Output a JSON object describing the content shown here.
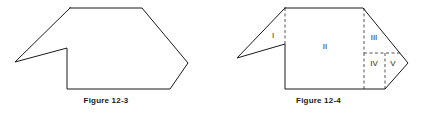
{
  "page": {
    "background_color": "#ffffff",
    "width": 425,
    "height": 115
  },
  "figures": [
    {
      "id": "figure-12-3",
      "caption": "Figure 12-3",
      "stroke_color": "#1a1a1a",
      "stroke_width": 1,
      "description": "Concave polygon outline: an arrow/house-like hexagonal shape with a notch cut into the left side",
      "outline_points": "70,8 142,8 188,63 170,89 67,89 67,48 15,62 70,8",
      "region_labels": []
    },
    {
      "id": "figure-12-4",
      "caption": "Figure 12-4",
      "stroke_color": "#1a1a1a",
      "stroke_width": 1,
      "dashed_color": "#555555",
      "description": "Same concave polygon as Figure 12-3 subdivided by dashed lines into five labeled regions",
      "outline_points": "285,8 363,8 408,63 385,89 285,89 285,44 237,58 285,8",
      "dashed_lines": [
        {
          "name": "divider-I-II",
          "x1": 285,
          "y1": 8,
          "x2": 285,
          "y2": 44
        },
        {
          "name": "divider-II-III",
          "x1": 364,
          "y1": 8,
          "x2": 364,
          "y2": 53
        },
        {
          "name": "divider-II-IV",
          "x1": 364,
          "y1": 53,
          "x2": 364,
          "y2": 89
        },
        {
          "name": "divider-III-IV",
          "x1": 364,
          "y1": 53,
          "x2": 401,
          "y2": 53
        },
        {
          "name": "divider-IV-V",
          "x1": 385,
          "y1": 53,
          "x2": 385,
          "y2": 89
        }
      ],
      "region_labels": [
        {
          "name": "region-label-i",
          "text": "I",
          "x": 273,
          "y": 36
        },
        {
          "name": "region-label-ii",
          "text": "II",
          "x": 325,
          "y": 47
        },
        {
          "name": "region-label-iii",
          "text": "III",
          "x": 374,
          "y": 38
        },
        {
          "name": "region-label-iv",
          "text": "IV",
          "x": 374,
          "y": 64
        },
        {
          "name": "region-label-v",
          "text": "V",
          "x": 393,
          "y": 64
        }
      ]
    }
  ]
}
